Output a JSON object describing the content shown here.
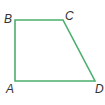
{
  "figure": {
    "type": "quadrilateral",
    "stroke_color": "#4caf6e",
    "vertices": [
      {
        "label": "A",
        "x": 15,
        "y": 81
      },
      {
        "label": "B",
        "x": 15,
        "y": 20
      },
      {
        "label": "C",
        "x": 63,
        "y": 20
      },
      {
        "label": "D",
        "x": 95,
        "y": 81
      }
    ]
  }
}
